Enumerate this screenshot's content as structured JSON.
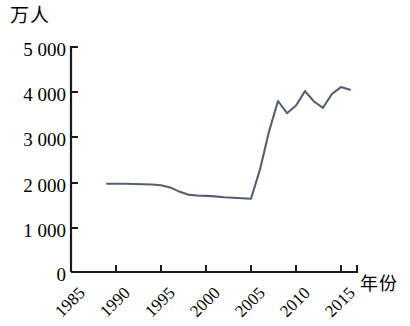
{
  "chart_data": {
    "type": "line",
    "title": "",
    "ylabel": "万人",
    "xlabel": "年份",
    "ylim": [
      0,
      5000
    ],
    "xlim": [
      1985,
      2017
    ],
    "grid": false,
    "legend": "none",
    "y_ticks": [
      "0",
      "1 000",
      "2 000",
      "3 000",
      "4 000",
      "5 000"
    ],
    "y_tick_values": [
      0,
      1000,
      2000,
      3000,
      4000,
      5000
    ],
    "x_ticks": [
      "1985",
      "1990",
      "1995",
      "2000",
      "2005",
      "2010",
      "2015"
    ],
    "x_tick_values": [
      1985,
      1990,
      1995,
      2000,
      2005,
      2010,
      2015
    ],
    "series": [
      {
        "name": "人数",
        "color": "#565f72",
        "x": [
          1989,
          1990,
          1991,
          1992,
          1993,
          1994,
          1995,
          1996,
          1997,
          1998,
          1999,
          2000,
          2001,
          2002,
          2003,
          2004,
          2005,
          2006,
          2007,
          2008,
          2009,
          2010,
          2011,
          2012,
          2013,
          2014,
          2015,
          2016
        ],
        "values": [
          1960,
          1960,
          1960,
          1955,
          1950,
          1945,
          1930,
          1880,
          1790,
          1720,
          1700,
          1690,
          1680,
          1660,
          1650,
          1640,
          1630,
          2280,
          3120,
          3800,
          3530,
          3700,
          4020,
          3790,
          3650,
          3960,
          4110,
          4050
        ]
      }
    ]
  }
}
